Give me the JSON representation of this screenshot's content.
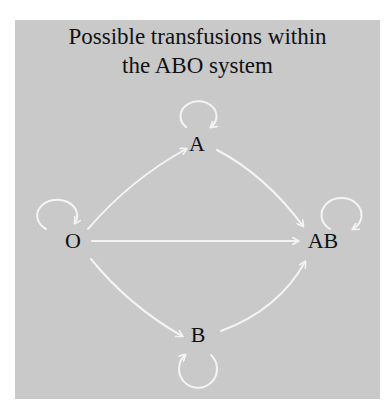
{
  "title": {
    "line1": "Possible transfusions within",
    "line2": "the ABO system"
  },
  "colors": {
    "background": "#c9c9c9",
    "arrow": "#f4f4f4",
    "text": "#111111"
  },
  "nodes": [
    {
      "id": "O",
      "label": "O"
    },
    {
      "id": "A",
      "label": "A"
    },
    {
      "id": "B",
      "label": "B"
    },
    {
      "id": "AB",
      "label": "AB"
    }
  ],
  "edges": [
    {
      "from": "O",
      "to": "A"
    },
    {
      "from": "O",
      "to": "B"
    },
    {
      "from": "O",
      "to": "AB"
    },
    {
      "from": "A",
      "to": "AB"
    },
    {
      "from": "B",
      "to": "AB"
    },
    {
      "from": "O",
      "to": "O",
      "type": "self-loop"
    },
    {
      "from": "A",
      "to": "A",
      "type": "self-loop"
    },
    {
      "from": "B",
      "to": "B",
      "type": "self-loop"
    },
    {
      "from": "AB",
      "to": "AB",
      "type": "self-loop"
    }
  ]
}
